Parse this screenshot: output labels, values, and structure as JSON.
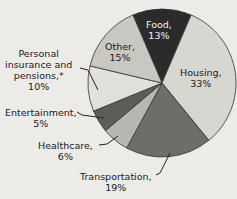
{
  "chart_data": {
    "type": "pie",
    "title": "",
    "slices": [
      {
        "label": "Food",
        "value": 13,
        "text": "Food,",
        "pct": "13%",
        "color": "#2b2b2b"
      },
      {
        "label": "Housing",
        "value": 33,
        "text": "Housing,",
        "pct": "33%",
        "color": "#d8d6d1"
      },
      {
        "label": "Transportation",
        "value": 19,
        "text": "Transportation,",
        "pct": "19%",
        "color": "#6e6d6a"
      },
      {
        "label": "Healthcare",
        "value": 6,
        "text": "Healthcare,",
        "pct": "6%",
        "color": "#b8b6b1"
      },
      {
        "label": "Entertainment",
        "value": 5,
        "text": "Entertainment,",
        "pct": "5%",
        "color": "#5d5c59"
      },
      {
        "label": "Personal insurance and pensions*",
        "value": 10,
        "text": "Personal insurance and pensions,*",
        "pct": "10%",
        "color": "#e2e0dc"
      },
      {
        "label": "Other",
        "value": 15,
        "text": "Other,",
        "pct": "15%",
        "color": "#c9c7c2"
      }
    ],
    "units": "%"
  },
  "labels": {
    "food": {
      "line1": "Food,",
      "line2": "13%"
    },
    "housing": {
      "line1": "Housing,",
      "line2": "33%"
    },
    "transportation": {
      "line1": "Transportation,",
      "line2": "19%"
    },
    "healthcare": {
      "line1": "Healthcare,",
      "line2": "6%"
    },
    "entertainment": {
      "line1": "Entertainment,",
      "line2": "5%"
    },
    "personal": {
      "line1": "Personal",
      "line2": "insurance and",
      "line3": "pensions,*",
      "line4": "10%"
    },
    "other": {
      "line1": "Other,",
      "line2": "15%"
    }
  }
}
